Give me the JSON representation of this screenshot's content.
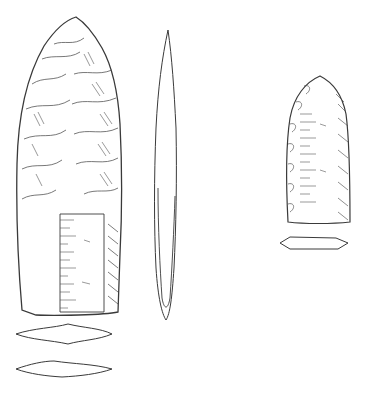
{
  "illustration": {
    "subject": "stone projectile points line drawing",
    "stroke_color": "#3a3a3a",
    "background": "#ffffff",
    "figures": [
      {
        "name": "large-point-face",
        "x": 14,
        "y": 14,
        "w": 112,
        "h": 300
      },
      {
        "name": "large-point-profile",
        "x": 148,
        "y": 28,
        "w": 36,
        "h": 296
      },
      {
        "name": "large-point-cross-section-1",
        "x": 14,
        "y": 322,
        "w": 100,
        "h": 22
      },
      {
        "name": "large-point-cross-section-2",
        "x": 14,
        "y": 358,
        "w": 100,
        "h": 20
      },
      {
        "name": "small-point-face",
        "x": 282,
        "y": 74,
        "w": 72,
        "h": 150
      },
      {
        "name": "small-point-cross-section",
        "x": 278,
        "y": 234,
        "w": 70,
        "h": 16
      }
    ]
  },
  "caption": {
    "text": "",
    "note": "caption clipped at bottom edge; illegible"
  }
}
